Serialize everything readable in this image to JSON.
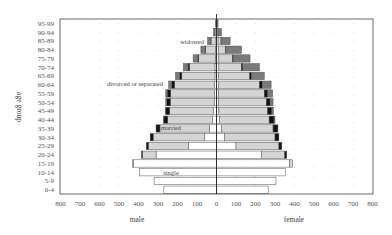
{
  "chart_data": {
    "type": "bar",
    "subtype": "population-pyramid-stacked",
    "title": "",
    "xlabel_left": "male",
    "xlabel_right": "female",
    "ylabel": "age group",
    "xlim": [
      0,
      800
    ],
    "x_ticks_left": [
      "800",
      "700",
      "600",
      "500",
      "400",
      "300",
      "200",
      "100",
      "0"
    ],
    "x_ticks_right": [
      "100",
      "200",
      "300",
      "400",
      "500",
      "600",
      "700",
      "800"
    ],
    "grid": "dotted",
    "categories": [
      "0-4",
      "5-9",
      "10-14",
      "15-19",
      "20-24",
      "25-29",
      "30-34",
      "35-39",
      "40-44",
      "45-49",
      "50-54",
      "55-59",
      "60-64",
      "65-69",
      "70-74",
      "75-79",
      "80-84",
      "85-89",
      "90-94",
      "95-99"
    ],
    "annotations": [
      "widowed",
      "divorced or separated",
      "married",
      "single"
    ],
    "colors": {
      "single": "#ffffff",
      "married": "#d4d4d4",
      "divorced or separated": "#111111",
      "widowed": "#7a7a7a",
      "edge": "#555555"
    },
    "male": {
      "series": [
        {
          "name": "single",
          "values": [
            270,
            320,
            395,
            425,
            310,
            145,
            60,
            35,
            20,
            15,
            12,
            10,
            10,
            8,
            8,
            6,
            5,
            3,
            2,
            1
          ]
        },
        {
          "name": "married",
          "values": [
            0,
            0,
            0,
            5,
            70,
            205,
            265,
            255,
            230,
            225,
            225,
            225,
            205,
            170,
            130,
            85,
            50,
            25,
            6,
            1
          ]
        },
        {
          "name": "divorced or separated",
          "values": [
            0,
            0,
            0,
            0,
            5,
            10,
            15,
            20,
            20,
            20,
            18,
            18,
            15,
            12,
            8,
            5,
            3,
            2,
            1,
            0
          ]
        },
        {
          "name": "widowed",
          "values": [
            0,
            0,
            0,
            0,
            0,
            0,
            0,
            0,
            2,
            3,
            5,
            7,
            15,
            20,
            24,
            24,
            22,
            15,
            6,
            3
          ]
        }
      ]
    },
    "female": {
      "series": [
        {
          "name": "single",
          "values": [
            265,
            305,
            355,
            375,
            230,
            100,
            40,
            25,
            15,
            12,
            10,
            10,
            10,
            10,
            12,
            12,
            10,
            8,
            5,
            2
          ]
        },
        {
          "name": "married",
          "values": [
            0,
            0,
            0,
            15,
            120,
            220,
            260,
            265,
            255,
            250,
            245,
            235,
            210,
            160,
            115,
            70,
            35,
            15,
            4,
            1
          ]
        },
        {
          "name": "divorced or separated",
          "values": [
            0,
            0,
            0,
            0,
            10,
            15,
            20,
            25,
            25,
            22,
            20,
            18,
            15,
            10,
            8,
            5,
            3,
            2,
            1,
            0
          ]
        },
        {
          "name": "widowed",
          "values": [
            0,
            0,
            0,
            0,
            0,
            0,
            0,
            0,
            5,
            8,
            15,
            25,
            45,
            65,
            85,
            85,
            80,
            45,
            15,
            5
          ]
        }
      ]
    }
  }
}
